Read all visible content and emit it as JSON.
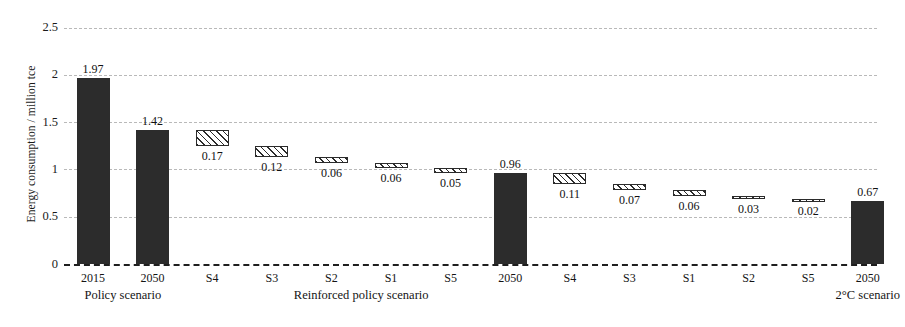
{
  "chart_data": {
    "type": "bar",
    "subtype": "waterfall",
    "title": "",
    "xlabel": "",
    "ylabel": "Energy consumption / million tce",
    "ylim": [
      0,
      2.5
    ],
    "yticks": [
      0,
      0.5,
      1,
      1.5,
      2,
      2.5
    ],
    "ytick_labels": [
      "0",
      "0.5",
      "1",
      "1.5",
      "2",
      "2.5"
    ],
    "grid": true,
    "legend": "none",
    "categories": [
      "2015",
      "2050",
      "S4",
      "S3",
      "S2",
      "S1",
      "S5",
      "2050",
      "S4",
      "S3",
      "S1",
      "S2",
      "S5",
      "2050"
    ],
    "groups": [
      {
        "label": "Policy scenario",
        "start_index": 0,
        "end_index": 1
      },
      {
        "label": "Reinforced policy scenario",
        "start_index": 2,
        "end_index": 7
      },
      {
        "label": "2°C scenario",
        "start_index": 13,
        "end_index": 13
      }
    ],
    "bars": [
      {
        "category": "2015",
        "label": "1.97",
        "value": 1.97,
        "base": 0,
        "top": 1.97,
        "style": "solid",
        "show_label": true
      },
      {
        "category": "2050",
        "label": "1.42",
        "value": 1.42,
        "base": 0,
        "top": 1.42,
        "style": "solid",
        "show_label": true
      },
      {
        "category": "S4",
        "label": "0.17",
        "value": 0.17,
        "base": 1.25,
        "top": 1.42,
        "style": "hatch",
        "show_label": true
      },
      {
        "category": "S3",
        "label": "0.12",
        "value": 0.12,
        "base": 1.13,
        "top": 1.25,
        "style": "hatch",
        "show_label": true
      },
      {
        "category": "S2",
        "label": "0.06",
        "value": 0.06,
        "base": 1.07,
        "top": 1.13,
        "style": "hatch",
        "show_label": true
      },
      {
        "category": "S1",
        "label": "0.06",
        "value": 0.06,
        "base": 1.01,
        "top": 1.07,
        "style": "hatch",
        "show_label": true
      },
      {
        "category": "S5",
        "label": "0.05",
        "value": 0.05,
        "base": 0.96,
        "top": 1.01,
        "style": "hatch",
        "show_label": true
      },
      {
        "category": "2050",
        "label": "0.96",
        "value": 0.96,
        "base": 0,
        "top": 0.96,
        "style": "solid",
        "show_label": true
      },
      {
        "category": "S4",
        "label": "0.11",
        "value": 0.11,
        "base": 0.85,
        "top": 0.96,
        "style": "hatch",
        "show_label": true
      },
      {
        "category": "S3",
        "label": "0.07",
        "value": 0.07,
        "base": 0.78,
        "top": 0.85,
        "style": "hatch",
        "show_label": true
      },
      {
        "category": "S1",
        "label": "0.06",
        "value": 0.06,
        "base": 0.72,
        "top": 0.78,
        "style": "hatch",
        "show_label": true
      },
      {
        "category": "S2",
        "label": "0.03",
        "value": 0.03,
        "base": 0.69,
        "top": 0.72,
        "style": "hatch",
        "show_label": true
      },
      {
        "category": "S5",
        "label": "0.02",
        "value": 0.02,
        "base": 0.67,
        "top": 0.69,
        "style": "hatch",
        "show_label": true
      },
      {
        "category": "2050",
        "label": "0.67",
        "value": 0.67,
        "base": 0,
        "top": 0.67,
        "style": "solid",
        "show_label": true
      }
    ],
    "colors": {
      "solid_bar": "#2c2c2c",
      "hatch_border": "#2b2b2b",
      "hatch_fill": "#ffffff",
      "gridline": "#b9b9b9",
      "zero_line": "#1f1f1f",
      "text": "#141414",
      "background": "#ffffff"
    }
  },
  "axis": {
    "y_title": "Energy consumption / million tce"
  }
}
